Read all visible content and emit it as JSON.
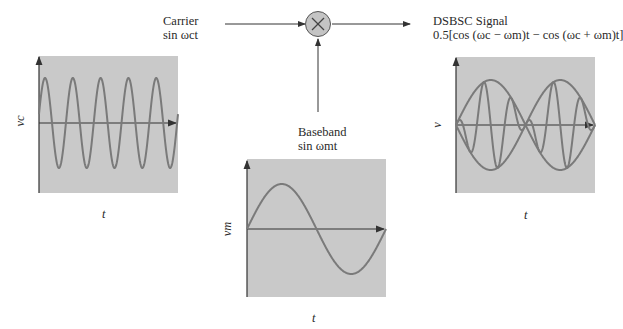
{
  "carrier": {
    "title": "Carrier",
    "formula": "sin ωct"
  },
  "baseband": {
    "title": "Baseband",
    "formula": "sin ωmt"
  },
  "output": {
    "title": "DSBSC Signal",
    "formula": "0.5[cos (ωc − ωm)t − cos (ωc + ωm)t]"
  },
  "mixer": {
    "symbol": "×"
  },
  "plots": {
    "carrier": {
      "ylabel": "vc",
      "xlabel": "t"
    },
    "baseband": {
      "ylabel": "vm",
      "xlabel": "t"
    },
    "dsbsc": {
      "ylabel": "v",
      "xlabel": "t"
    }
  },
  "colors": {
    "plot_bg": "#c9c9c9",
    "wave": "#7a7a7a",
    "axis": "#333333",
    "mixer_fill": "#c4c4c4"
  },
  "chart_data": [
    {
      "type": "line",
      "title": "Carrier",
      "xlabel": "t",
      "ylabel": "vc",
      "description": "sin ωc t, ~5 cycles",
      "cycles": 5
    },
    {
      "type": "line",
      "title": "Baseband",
      "xlabel": "t",
      "ylabel": "vm",
      "description": "sin ωm t, 1 cycle",
      "cycles": 1
    },
    {
      "type": "line",
      "title": "DSBSC Signal",
      "xlabel": "t",
      "ylabel": "v",
      "description": "product of carrier and baseband with ± envelope",
      "envelope_cycles": 1
    }
  ]
}
